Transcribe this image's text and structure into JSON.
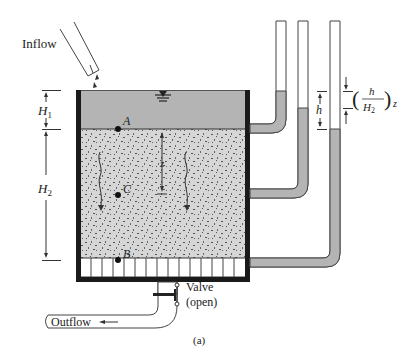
{
  "figure": {
    "caption": "(a)",
    "labels": {
      "inflow": "Inflow",
      "outflow": "Outflow",
      "valve": "Valve",
      "valve_state": "(open)",
      "h1": "H",
      "h1_sub": "1",
      "h2": "H",
      "h2_sub": "2",
      "point_a": "A",
      "point_b": "B",
      "point_c": "C",
      "z": "z",
      "h": "h",
      "frac_num": "h",
      "frac_den": "H",
      "frac_den_sub": "2",
      "frac_z": "z"
    },
    "colors": {
      "water": "#b4b4b4",
      "soil": "#d6d6d6",
      "speckle": "#555555",
      "wall": "#1a1a1a",
      "line": "#444444"
    }
  }
}
